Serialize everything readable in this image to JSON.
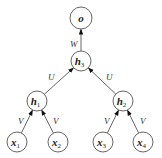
{
  "diagram": {
    "type": "recursive-neural-network-tree",
    "nodes": [
      {
        "id": "o",
        "label": "o",
        "sub": "",
        "x": 81,
        "y": 18,
        "r": 11
      },
      {
        "id": "h3",
        "label": "h",
        "sub": "3",
        "x": 81,
        "y": 61,
        "r": 10
      },
      {
        "id": "h1",
        "label": "h",
        "sub": "1",
        "x": 37,
        "y": 101,
        "r": 10
      },
      {
        "id": "h2",
        "label": "h",
        "sub": "2",
        "x": 123,
        "y": 101,
        "r": 10
      },
      {
        "id": "x1",
        "label": "x",
        "sub": "1",
        "x": 17,
        "y": 142,
        "r": 10
      },
      {
        "id": "x2",
        "label": "x",
        "sub": "2",
        "x": 58,
        "y": 142,
        "r": 10
      },
      {
        "id": "x3",
        "label": "x",
        "sub": "3",
        "x": 103,
        "y": 142,
        "r": 10
      },
      {
        "id": "x4",
        "label": "x",
        "sub": "4",
        "x": 143,
        "y": 142,
        "r": 10
      }
    ],
    "edges": [
      {
        "from": "h3",
        "to": "o",
        "label": "W",
        "lx": 70,
        "ly": 47
      },
      {
        "from": "h1",
        "to": "h3",
        "label": "U",
        "lx": 48,
        "ly": 80
      },
      {
        "from": "h2",
        "to": "h3",
        "label": "U",
        "lx": 106,
        "ly": 80
      },
      {
        "from": "x1",
        "to": "h1",
        "label": "V",
        "lx": 18,
        "ly": 124
      },
      {
        "from": "x2",
        "to": "h1",
        "label": "V",
        "lx": 53,
        "ly": 124
      },
      {
        "from": "x3",
        "to": "h2",
        "label": "V",
        "lx": 104,
        "ly": 124
      },
      {
        "from": "x4",
        "to": "h2",
        "label": "V",
        "lx": 140,
        "ly": 124
      }
    ]
  }
}
